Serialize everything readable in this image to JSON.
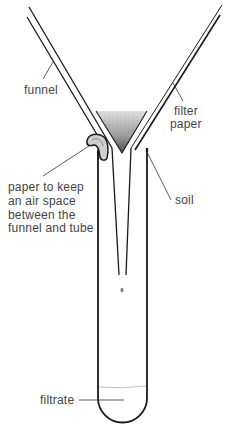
{
  "diagram": {
    "colors": {
      "line": "#1a1a1a",
      "label_text": "#444444",
      "soil_dark": "#555555",
      "soil_light": "#dddddd",
      "filtrate_line": "#bbbbbb"
    },
    "labels": {
      "funnel": "funnel",
      "filter_paper_line1": "filter",
      "filter_paper_line2": "paper",
      "air_space_line1": "paper to keep",
      "air_space_line2": "an air space",
      "air_space_line3": "between the",
      "air_space_line4": "funnel and tube",
      "soil": "soil",
      "filtrate": "filtrate"
    },
    "components": [
      "funnel",
      "filter paper",
      "soil",
      "paper wedge (air space)",
      "test tube",
      "filtrate",
      "water drop"
    ]
  }
}
